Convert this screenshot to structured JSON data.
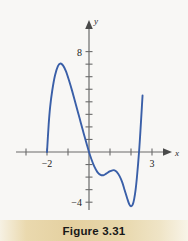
{
  "figure": {
    "caption": "Figure 3.31",
    "background_color": "#f8f7f5",
    "caption_band_color": "#e4d0a0"
  },
  "chart_data": {
    "type": "line",
    "title": "",
    "subtitle": "",
    "xlabel": "x",
    "ylabel": "y",
    "xlim": [
      -3.5,
      3.6
    ],
    "ylim": [
      -5.6,
      8.8
    ],
    "grid": false,
    "legend": null,
    "axis_color": "#6b6b6b",
    "curve_color": "#3a5fa8",
    "x_ticks": [
      -3,
      -2,
      -1,
      1,
      2,
      3
    ],
    "x_tick_labels": [
      "",
      "−2",
      "",
      "",
      "",
      "3"
    ],
    "y_ticks": [
      -4,
      -3,
      -2,
      -1,
      1,
      2,
      3,
      4,
      5,
      6,
      7,
      8
    ],
    "y_tick_labels": [
      "−4",
      "",
      "",
      "",
      "",
      "",
      "",
      "",
      "",
      "",
      "",
      "8"
    ],
    "annotations": [],
    "series": [
      {
        "name": "f(x)",
        "color": "#3a5fa8",
        "points": [
          [
            -2.0,
            0.0
          ],
          [
            -1.92,
            2.2
          ],
          [
            -1.85,
            3.6
          ],
          [
            -1.75,
            4.9
          ],
          [
            -1.62,
            6.1
          ],
          [
            -1.48,
            6.85
          ],
          [
            -1.36,
            7.05
          ],
          [
            -1.24,
            6.9
          ],
          [
            -1.1,
            6.45
          ],
          [
            -0.95,
            5.7
          ],
          [
            -0.8,
            4.85
          ],
          [
            -0.62,
            3.75
          ],
          [
            -0.45,
            2.7
          ],
          [
            -0.28,
            1.65
          ],
          [
            -0.12,
            0.7
          ],
          [
            0.0,
            0.0
          ],
          [
            0.12,
            -0.6
          ],
          [
            0.25,
            -1.15
          ],
          [
            0.4,
            -1.6
          ],
          [
            0.55,
            -1.82
          ],
          [
            0.68,
            -1.85
          ],
          [
            0.82,
            -1.72
          ],
          [
            0.98,
            -1.55
          ],
          [
            1.12,
            -1.46
          ],
          [
            1.22,
            -1.46
          ],
          [
            1.32,
            -1.58
          ],
          [
            1.45,
            -1.9
          ],
          [
            1.58,
            -2.4
          ],
          [
            1.7,
            -3.05
          ],
          [
            1.82,
            -3.7
          ],
          [
            1.92,
            -4.18
          ],
          [
            2.0,
            -4.32
          ],
          [
            2.08,
            -4.2
          ],
          [
            2.15,
            -3.75
          ],
          [
            2.22,
            -3.0
          ],
          [
            2.28,
            -2.05
          ],
          [
            2.34,
            -0.9
          ],
          [
            2.4,
            0.4
          ],
          [
            2.45,
            1.7
          ],
          [
            2.5,
            3.1
          ],
          [
            2.55,
            4.5
          ]
        ]
      }
    ]
  }
}
